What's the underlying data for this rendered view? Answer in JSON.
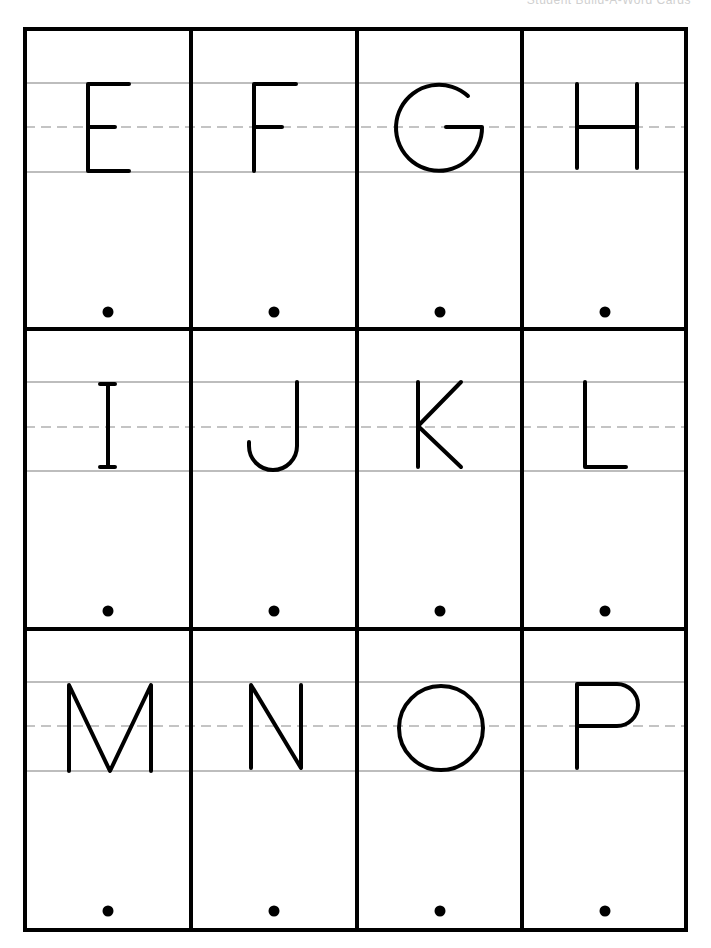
{
  "header": {
    "title": "Student Build-A-Word Cards"
  },
  "colors": {
    "border": "#000000",
    "guide_line": "#bdbdbd",
    "dashed_line": "#c4c4c4",
    "letter": "#000000",
    "background": "#ffffff"
  },
  "grid": {
    "rows": 3,
    "columns": 4
  },
  "cards": [
    {
      "letter": "E"
    },
    {
      "letter": "F"
    },
    {
      "letter": "G"
    },
    {
      "letter": "H"
    },
    {
      "letter": "I"
    },
    {
      "letter": "J"
    },
    {
      "letter": "K"
    },
    {
      "letter": "L"
    },
    {
      "letter": "M"
    },
    {
      "letter": "N"
    },
    {
      "letter": "O"
    },
    {
      "letter": "P"
    }
  ]
}
